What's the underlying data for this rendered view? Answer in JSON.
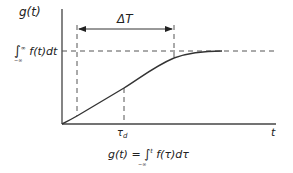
{
  "diagram": {
    "type": "step-response ramp curve",
    "y_axis_label": "g(t)",
    "x_axis_label": "t",
    "asymptote_label": {
      "integral_sign": "∫",
      "upper_limit": "∞",
      "lower_limit": "−∞",
      "integrand": "f(t)dt"
    },
    "interval_label": "ΔT",
    "delay_label": {
      "symbol": "τ",
      "subscript": "d"
    },
    "formula": {
      "lhs": "g(t) = ",
      "integral_sign": "∫",
      "upper_limit": "t",
      "lower_limit": "−∞",
      "integrand": " f(τ)dτ"
    },
    "colors": {
      "line": "#333333",
      "dashed": "#555555",
      "background": "#ffffff"
    }
  }
}
